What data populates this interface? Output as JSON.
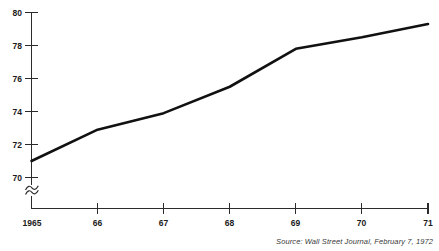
{
  "chart_data": {
    "type": "line",
    "title": "",
    "subtitle": "",
    "xlabel": "",
    "ylabel": "",
    "x": [
      1965,
      1966,
      1967,
      1968,
      1969,
      1970,
      1971
    ],
    "x_tick_labels": [
      "1965",
      "66",
      "67",
      "68",
      "69",
      "70",
      "71"
    ],
    "y_tick_labels": [
      "70",
      "72",
      "74",
      "76",
      "78",
      "80"
    ],
    "y_ticks": [
      70,
      72,
      74,
      76,
      78,
      80
    ],
    "values": [
      71.0,
      72.9,
      73.9,
      75.5,
      77.8,
      78.5,
      79.3
    ],
    "series": [
      {
        "name": "",
        "values": [
          71.0,
          72.9,
          73.9,
          75.5,
          77.8,
          78.5,
          79.3
        ]
      }
    ],
    "xlim": [
      1965,
      1971
    ],
    "ylim": [
      70,
      80
    ],
    "grid": false,
    "legend": false,
    "y_axis_break": true,
    "line_color": "#111111"
  },
  "annotations": {
    "source": "Source: Wall Street Journal, February 7, 1972"
  },
  "colors": {
    "line": "#111111",
    "axis": "#2b2b2b",
    "text": "#1a1a1a",
    "source_text": "#3a3a3a",
    "background": "#ffffff"
  }
}
